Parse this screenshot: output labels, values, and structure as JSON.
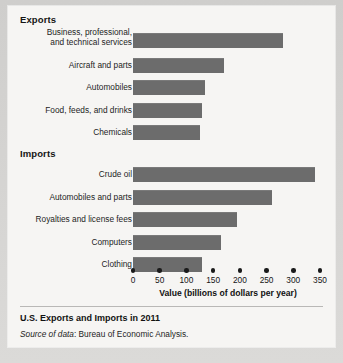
{
  "figure": {
    "caption_title": "U.S. Exports and Imports in 2011",
    "source_prefix": "Source of data",
    "source_rest": ": Bureau of Economic Analysis."
  },
  "colors": {
    "bar_fill": "#6c6c6c",
    "card_background": "#f6f5f3",
    "page_background": "#d5d4d2",
    "text": "#1a1a1a"
  },
  "chart_data": {
    "type": "bar",
    "orientation": "horizontal",
    "title": "U.S. Exports and Imports in 2011",
    "xlabel": "Value (billions of dollars per year)",
    "ylabel": "",
    "xlim": [
      0,
      350
    ],
    "xticks": [
      0,
      50,
      100,
      150,
      200,
      250,
      300,
      350
    ],
    "xticklabels": [
      "0",
      "50",
      "100",
      "150",
      "200",
      "250",
      "300",
      "350"
    ],
    "grid": false,
    "legend": "none",
    "groups": [
      {
        "name": "Exports",
        "categories": [
          "Business, professional,\nand technical services",
          "Aircraft and parts",
          "Automobiles",
          "Food, feeds, and drinks",
          "Chemicals"
        ],
        "values": [
          280,
          170,
          135,
          130,
          125
        ]
      },
      {
        "name": "Imports",
        "categories": [
          "Crude oil",
          "Automobiles and parts",
          "Royalties and license fees",
          "Computers",
          "Clothing"
        ],
        "values": [
          340,
          260,
          195,
          165,
          130
        ]
      }
    ]
  }
}
